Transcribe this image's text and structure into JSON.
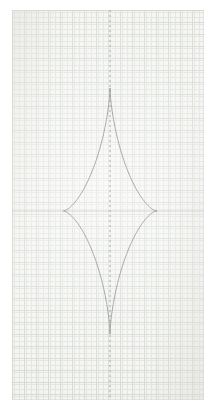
{
  "page": {
    "width": 216,
    "height": 412,
    "background_color": "#ffffff",
    "title": "Astroid curve plotted on graph paper"
  },
  "paper": {
    "label": "graph-paper-sheet",
    "x": 12,
    "y": 10,
    "width": 192,
    "height": 390,
    "paper_color": "#f4f4f1",
    "edge_color": "#d2d2cd"
  },
  "grid": {
    "visible": true,
    "minor_spacing_px": 2.4,
    "minor_color": "#e2e4e0",
    "major_spacing_px": 12,
    "major_color": "#d6d9d4",
    "description": "fine engineering graph paper, faint blue-grey ruling"
  },
  "axes": {
    "vertical": {
      "label": "vertical-axis",
      "x": 110,
      "style": "dashed",
      "color": "#9a9a9c",
      "dash_pattern": "2 3"
    },
    "horizontal": {
      "label": "horizontal-axis",
      "y": 211,
      "style": "solid-faint",
      "color": "#c9cbc7"
    }
  },
  "chart_data": {
    "type": "line",
    "title": "Astroid",
    "subtitle": "",
    "xlabel": "",
    "ylabel": "",
    "grid": true,
    "legend": "none",
    "equation": "(x/a)^(2/3) + (y/b)^(2/3) = 1",
    "parametric": "x = cx + a*cos(t)^3,  y = cy + b*sin(t)^3",
    "center": {
      "x": 110,
      "y": 211
    },
    "semi_axis_x": 46.5,
    "semi_axis_y": 123,
    "xlim": [
      12,
      204
    ],
    "ylim": [
      10,
      400
    ],
    "stroke_color": "#8d8d90",
    "stroke_width": 0.8,
    "cusps": [
      {
        "name": "top-cusp",
        "x": 110,
        "y": 88
      },
      {
        "name": "right-cusp",
        "x": 156.5,
        "y": 211
      },
      {
        "name": "bottom-cusp",
        "x": 110,
        "y": 334
      },
      {
        "name": "left-cusp",
        "x": 63.5,
        "y": 211
      }
    ],
    "series": [
      {
        "name": "astroid-outline",
        "closed": true,
        "x": [
          110.0,
          109.8,
          109.2,
          108.3,
          107.0,
          105.3,
          103.4,
          101.1,
          98.6,
          95.9,
          93.0,
          90.0,
          87.0,
          84.0,
          81.1,
          78.4,
          75.9,
          73.6,
          71.7,
          70.0,
          68.7,
          67.8,
          67.2,
          66.8,
          66.5,
          64.9,
          63.5,
          64.9,
          66.5,
          66.8,
          67.2,
          67.8,
          68.7,
          70.0,
          71.7,
          73.6,
          75.9,
          78.4,
          81.1,
          84.0,
          87.0,
          90.0,
          93.0,
          95.9,
          98.6,
          101.1,
          103.4,
          105.3,
          107.0,
          108.3,
          109.2,
          109.8,
          110.0,
          110.2,
          110.8,
          111.7,
          113.0,
          114.7,
          116.6,
          118.9,
          121.4,
          124.1,
          127.0,
          130.0,
          133.0,
          136.0,
          138.9,
          141.6,
          144.1,
          146.4,
          148.3,
          150.0,
          151.3,
          152.2,
          152.8,
          153.2,
          153.5,
          155.1,
          156.5,
          155.1,
          153.5,
          153.2,
          152.8,
          152.2,
          151.3,
          150.0,
          148.3,
          146.4,
          144.1,
          141.6,
          138.9,
          136.0,
          133.0,
          130.0,
          127.0,
          124.1,
          121.4,
          118.9,
          116.6,
          114.7,
          113.0,
          111.7,
          110.8,
          110.2,
          110.0
        ],
        "y": [
          88.0,
          90.4,
          95.2,
          102.3,
          111.5,
          122.5,
          135.1,
          149.0,
          163.8,
          179.1,
          194.5,
          209.6,
          223.9,
          237.0,
          248.6,
          258.4,
          266.3,
          272.2,
          276.2,
          278.6,
          279.9,
          280.5,
          280.8,
          280.9,
          281.0,
          281.0,
          211.0,
          141.0,
          141.0,
          141.1,
          141.2,
          141.5,
          142.1,
          143.4,
          145.8,
          149.7,
          155.6,
          163.5,
          173.4,
          185.0,
          198.1,
          212.4,
          227.5,
          243.0,
          258.5,
          273.6,
          287.9,
          301.0,
          312.6,
          322.4,
          330.3,
          336.1,
          334.0,
          336.1,
          330.3,
          322.4,
          312.6,
          301.0,
          287.9,
          273.6,
          258.5,
          243.0,
          227.5,
          212.4,
          198.1,
          185.0,
          173.4,
          163.5,
          155.6,
          149.7,
          145.8,
          143.4,
          142.1,
          141.5,
          141.2,
          141.1,
          141.0,
          141.0,
          211.0,
          281.0,
          281.0,
          280.9,
          280.8,
          280.5,
          279.9,
          278.6,
          276.2,
          272.2,
          266.3,
          258.4,
          248.6,
          237.0,
          223.9,
          209.6,
          194.5,
          179.1,
          163.8,
          149.0,
          135.1,
          122.5,
          111.5,
          102.3,
          95.2,
          90.4,
          88.0
        ]
      }
    ]
  }
}
